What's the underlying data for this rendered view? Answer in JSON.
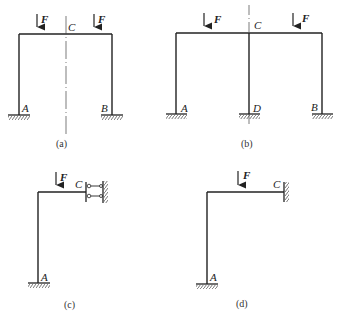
{
  "figures": [
    {
      "caption": "(a)",
      "load_label": "F",
      "nodes": {
        "left_base": "A",
        "right_base": "B",
        "top_center": "C"
      }
    },
    {
      "caption": "(b)",
      "load_label": "F",
      "nodes": {
        "left_base": "A",
        "middle_base": "D",
        "right_base": "B",
        "top_center": "C"
      }
    },
    {
      "caption": "(c)",
      "load_label": "F",
      "nodes": {
        "base": "A",
        "end": "C"
      }
    },
    {
      "caption": "(d)",
      "load_label": "F",
      "nodes": {
        "base": "A",
        "end": "C"
      }
    }
  ],
  "colors": {
    "line": "#222222",
    "hatch": "#555555"
  }
}
